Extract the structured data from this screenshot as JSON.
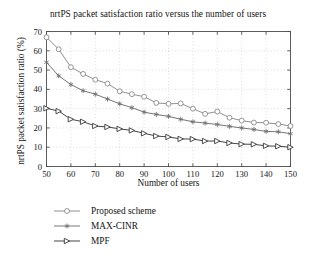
{
  "chart_data": {
    "type": "line",
    "title": "nrtPS packet satisfaction ratio versus the number of users",
    "xlabel": "Number of users",
    "ylabel": "nrtPS packet satisfaction ratio (%)",
    "xlim": [
      50,
      150
    ],
    "ylim": [
      0,
      70
    ],
    "xticks": [
      50,
      60,
      70,
      80,
      90,
      100,
      110,
      120,
      130,
      140,
      150
    ],
    "yticks": [
      0,
      10,
      20,
      30,
      40,
      50,
      60,
      70
    ],
    "grid": true,
    "legend_position": "below",
    "x": [
      50,
      55,
      60,
      65,
      70,
      75,
      80,
      85,
      90,
      95,
      100,
      105,
      110,
      115,
      120,
      125,
      130,
      135,
      140,
      145,
      150
    ],
    "series": [
      {
        "name": "Proposed scheme",
        "marker": "circle-open",
        "color": "#8a8a8a",
        "values": [
          67.0,
          60.8,
          51.5,
          48.0,
          45.0,
          43.0,
          39.0,
          37.5,
          36.2,
          33.0,
          32.5,
          32.7,
          30.0,
          27.3,
          28.5,
          25.3,
          23.8,
          22.8,
          22.7,
          22.0,
          21.0
        ]
      },
      {
        "name": "MAX-CINR",
        "marker": "asterisk",
        "color": "#6e6e6e",
        "values": [
          54.0,
          47.0,
          42.5,
          39.3,
          37.5,
          35.0,
          32.5,
          30.5,
          28.2,
          27.0,
          26.0,
          24.5,
          23.2,
          22.5,
          21.8,
          20.8,
          20.0,
          19.2,
          18.2,
          18.0,
          17.0
        ]
      },
      {
        "name": "MPF",
        "marker": "triangle-right",
        "color": "#3a3a3a",
        "values": [
          30.2,
          28.7,
          24.5,
          23.2,
          21.0,
          20.5,
          19.5,
          18.7,
          17.2,
          15.8,
          15.3,
          14.3,
          14.2,
          13.2,
          13.2,
          12.2,
          11.6,
          11.5,
          10.7,
          10.5,
          10.0
        ]
      }
    ]
  },
  "legend": {
    "items": [
      {
        "label": "Proposed scheme"
      },
      {
        "label": "MAX-CINR"
      },
      {
        "label": "MPF"
      }
    ]
  },
  "style": {
    "axis_color": "#4d4d4d",
    "grid_color": "#b9b9b9",
    "text_color": "#151515",
    "background": "#ffffff"
  }
}
